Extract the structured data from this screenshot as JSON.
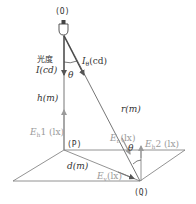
{
  "diagram": {
    "points": {
      "source": "(O)",
      "foot": "(P)",
      "target": "(Q)"
    },
    "labels": {
      "luminous_intensity_jp": "光度",
      "luminous_intensity": "I(cd)",
      "intensity_theta_symbol": "I",
      "intensity_theta_sub": "θ",
      "intensity_theta_unit": "(cd)",
      "angle_top": "θ",
      "height": "h(m)",
      "distance_r": "r(m)",
      "illum_h1_symbol": "E",
      "illum_h1_sub": "h",
      "illum_h1_rest": "1 (lx)",
      "illum_n_symbol": "E",
      "illum_n_sub": "n",
      "illum_n_rest": "(lx)",
      "angle_bottom": "θ",
      "illum_h2_symbol": "E",
      "illum_h2_sub": "h",
      "illum_h2_rest": "2 (lx)",
      "distance_d": "d(m)",
      "illum_v_symbol": "E",
      "illum_v_sub": "v",
      "illum_v_rest": "(lx)"
    },
    "colors": {
      "line_dark": "#555555",
      "line_gray": "#9a9a9a",
      "text": "#333333"
    }
  }
}
